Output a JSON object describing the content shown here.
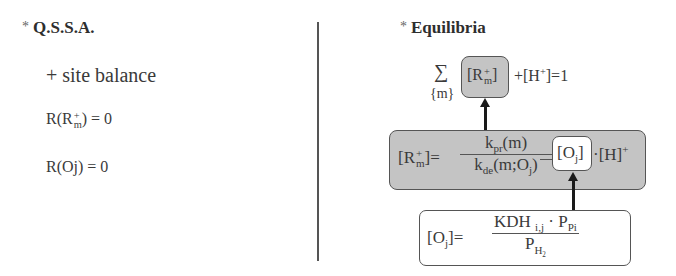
{
  "left": {
    "title_star": "*",
    "title": "Q.S.S.A.",
    "subtitle": "+ site balance",
    "eq1": {
      "prefix": "R(R",
      "sup": "+",
      "sub": "m",
      "suffix": ") = 0"
    },
    "eq2": "R(Oj) = 0"
  },
  "right": {
    "title_star": "*",
    "title": "Equilibria",
    "balance": {
      "sigma": "∑",
      "sigma_sub": "{m}",
      "box_open": "[R",
      "box_sup": "+",
      "box_sub": "m",
      "box_close": "]",
      "rest": "+[H",
      "rest_sup": "+",
      "rest_end": "]=1"
    },
    "rm_eq": {
      "lhs_open": "[R",
      "lhs_sup": "+",
      "lhs_sub": "m",
      "lhs_close": "]=",
      "num_k": "k",
      "num_sub": "pr",
      "num_rest": "(m)",
      "den_k": "k",
      "den_sub": "de",
      "den_rest": "(m;O",
      "den_sub2": "j",
      "den_end": ")",
      "oj_open": "[O",
      "oj_sub": "j",
      "oj_close": "]",
      "dot": "·",
      "h": "[H]",
      "h_sup": "+"
    },
    "oj_eq": {
      "lhs_open": "[O",
      "lhs_sub": "j",
      "lhs_close": "]=",
      "num_kdh": "KDH",
      "num_kdh_sub": "i,j",
      "num_dot": " · ",
      "num_p": "P",
      "num_p_sub": "Pi",
      "den_p": "P",
      "den_p_sub": "H",
      "den_p_sub2": "2"
    }
  }
}
